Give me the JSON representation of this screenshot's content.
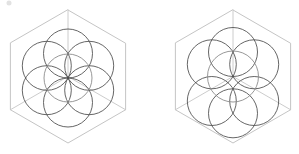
{
  "image": {
    "title": "Isometric sphere-packing diagrams",
    "width": 299,
    "height": 154,
    "background_color": "#ffffff",
    "figure_count": 2
  },
  "palette": {
    "cube_edge_color": "#bdbdbd",
    "cube_inner_edge_color": "#c6c6c6",
    "sphere_outline_color": "#4a4a4a",
    "center_sphere_outline_color": "#8c8c8c",
    "speck_color": "#e2e2e2",
    "background": "#ffffff"
  },
  "figures": [
    {
      "id": "figure-left",
      "label": "Hexagonal close packing",
      "caption": "",
      "cube": {
        "center": [
          68,
          76.5
        ],
        "radius": 66.5,
        "vertices": [
          [
            68,
            10
          ],
          [
            125.6,
            43.25
          ],
          [
            125.6,
            109.75
          ],
          [
            68,
            143
          ],
          [
            10.4,
            109.75
          ],
          [
            10.4,
            43.25
          ]
        ],
        "inner_vertex": [
          68,
          76.5
        ],
        "inner_edges": [
          [
            68,
            10
          ],
          [
            125.6,
            109.75
          ],
          [
            10.4,
            109.75
          ]
        ]
      },
      "spheres": {
        "arrangement": "flower-of-life ring of 6 around 1 center",
        "count": 7,
        "radius": 24.5,
        "ring_radius": 24.5,
        "ring_start_angle_deg": -90,
        "center": [
          68,
          78
        ],
        "center_sphere_radius": 24.0,
        "ring_centers": [
          [
            68,
            53.5
          ],
          [
            89.2,
            65.8
          ],
          [
            89.2,
            90.2
          ],
          [
            68,
            102.5
          ],
          [
            46.8,
            90.2
          ],
          [
            46.8,
            65.8
          ]
        ]
      }
    },
    {
      "id": "figure-right",
      "label": "Cubic close packing",
      "caption": "",
      "cube": {
        "center": [
          233,
          76.5
        ],
        "radius": 66.5,
        "vertices": [
          [
            233,
            10
          ],
          [
            290.6,
            43.25
          ],
          [
            290.6,
            109.75
          ],
          [
            233,
            143
          ],
          [
            175.4,
            109.75
          ],
          [
            175.4,
            43.25
          ]
        ],
        "inner_vertex": [
          233,
          76.5
        ],
        "inner_edges": [
          [
            233,
            10
          ],
          [
            290.6,
            109.75
          ],
          [
            175.4,
            109.75
          ]
        ]
      },
      "spheres": {
        "arrangement": "6 face spheres around 1 center, cubic axes",
        "count": 7,
        "radius": 24.5,
        "center": [
          233,
          76.5
        ],
        "center_sphere_radius": 25.5,
        "outer_centers": [
          [
            233,
            52.0
          ],
          [
            254.2,
            64.3
          ],
          [
            254.2,
            101.0
          ],
          [
            233,
            113.3
          ],
          [
            211.8,
            101.0
          ],
          [
            211.8,
            64.3
          ]
        ]
      }
    }
  ],
  "artifacts": {
    "speck": {
      "position": [
        9,
        3
      ],
      "radius": 2.5,
      "visible": true
    }
  }
}
